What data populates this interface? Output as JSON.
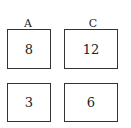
{
  "columns": [
    {
      "label": "A"
    },
    {
      "label": "C"
    }
  ],
  "boxes": [
    {
      "value": "8"
    },
    {
      "value": "12"
    },
    {
      "value": "3"
    },
    {
      "value": "6"
    }
  ]
}
